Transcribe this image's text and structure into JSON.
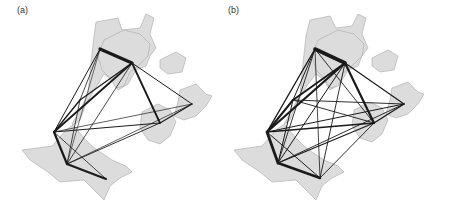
{
  "figure": {
    "colors": {
      "land": "#dcdcdc",
      "land_stroke": "#a8a8a8",
      "edge": "#1a1a1a",
      "background": "#ffffff"
    },
    "panels": [
      {
        "id": "a",
        "label": "(a)",
        "label_pos": [
          17,
          14
        ],
        "offset": [
          0,
          0
        ],
        "nodes": [
          {
            "id": "n1",
            "x": 100,
            "y": 49
          },
          {
            "id": "n2",
            "x": 132,
            "y": 63
          },
          {
            "id": "n3",
            "x": 192,
            "y": 104
          },
          {
            "id": "n4",
            "x": 160,
            "y": 123
          },
          {
            "id": "n5",
            "x": 54,
            "y": 132
          },
          {
            "id": "n6",
            "x": 67,
            "y": 164
          },
          {
            "id": "n7",
            "x": 106,
            "y": 179
          },
          {
            "id": "n8",
            "x": 80,
            "y": 100
          }
        ],
        "edges": [
          {
            "from": "n1",
            "to": "n2",
            "w": 3.2
          },
          {
            "from": "n2",
            "to": "n3",
            "w": 1.0
          },
          {
            "from": "n2",
            "to": "n4",
            "w": 1.8
          },
          {
            "from": "n3",
            "to": "n4",
            "w": 1.2
          },
          {
            "from": "n2",
            "to": "n5",
            "w": 1.8
          },
          {
            "from": "n2",
            "to": "n8",
            "w": 1.2
          },
          {
            "from": "n2",
            "to": "n6",
            "w": 0.8
          },
          {
            "from": "n1",
            "to": "n5",
            "w": 1.0
          },
          {
            "from": "n1",
            "to": "n8",
            "w": 0.8
          },
          {
            "from": "n1",
            "to": "n6",
            "w": 0.6
          },
          {
            "from": "n5",
            "to": "n4",
            "w": 1.0
          },
          {
            "from": "n5",
            "to": "n3",
            "w": 0.7
          },
          {
            "from": "n5",
            "to": "n6",
            "w": 2.2
          },
          {
            "from": "n5",
            "to": "n7",
            "w": 0.8
          },
          {
            "from": "n6",
            "to": "n7",
            "w": 2.0
          },
          {
            "from": "n6",
            "to": "n4",
            "w": 0.9
          },
          {
            "from": "n6",
            "to": "n3",
            "w": 0.7
          },
          {
            "from": "n8",
            "to": "n5",
            "w": 1.4
          },
          {
            "from": "n8",
            "to": "n6",
            "w": 0.8
          }
        ]
      },
      {
        "id": "b",
        "label": "(b)",
        "label_pos": [
          228,
          14
        ],
        "offset": [
          0,
          0
        ],
        "nodes": [
          {
            "id": "n1",
            "x": 315,
            "y": 49
          },
          {
            "id": "n2",
            "x": 345,
            "y": 63
          },
          {
            "id": "n3",
            "x": 404,
            "y": 104
          },
          {
            "id": "n4",
            "x": 374,
            "y": 123
          },
          {
            "id": "n5",
            "x": 267,
            "y": 132
          },
          {
            "id": "n6",
            "x": 278,
            "y": 163
          },
          {
            "id": "n7",
            "x": 320,
            "y": 178
          },
          {
            "id": "n8",
            "x": 293,
            "y": 100
          }
        ],
        "edges": [
          {
            "from": "n1",
            "to": "n2",
            "w": 3.6
          },
          {
            "from": "n2",
            "to": "n3",
            "w": 1.2
          },
          {
            "from": "n2",
            "to": "n4",
            "w": 2.2
          },
          {
            "from": "n3",
            "to": "n4",
            "w": 1.4
          },
          {
            "from": "n2",
            "to": "n5",
            "w": 2.2
          },
          {
            "from": "n2",
            "to": "n8",
            "w": 1.8
          },
          {
            "from": "n2",
            "to": "n6",
            "w": 1.0
          },
          {
            "from": "n2",
            "to": "n7",
            "w": 0.9
          },
          {
            "from": "n1",
            "to": "n5",
            "w": 1.4
          },
          {
            "from": "n1",
            "to": "n8",
            "w": 1.0
          },
          {
            "from": "n1",
            "to": "n6",
            "w": 0.9
          },
          {
            "from": "n1",
            "to": "n4",
            "w": 0.9
          },
          {
            "from": "n1",
            "to": "n7",
            "w": 0.8
          },
          {
            "from": "n5",
            "to": "n4",
            "w": 1.4
          },
          {
            "from": "n5",
            "to": "n3",
            "w": 1.0
          },
          {
            "from": "n5",
            "to": "n6",
            "w": 2.8
          },
          {
            "from": "n5",
            "to": "n7",
            "w": 1.0
          },
          {
            "from": "n6",
            "to": "n7",
            "w": 2.4
          },
          {
            "from": "n6",
            "to": "n4",
            "w": 1.2
          },
          {
            "from": "n6",
            "to": "n3",
            "w": 0.9
          },
          {
            "from": "n7",
            "to": "n4",
            "w": 0.9
          },
          {
            "from": "n8",
            "to": "n5",
            "w": 2.0
          },
          {
            "from": "n8",
            "to": "n6",
            "w": 1.0
          },
          {
            "from": "n8",
            "to": "n3",
            "w": 0.9
          },
          {
            "from": "n8",
            "to": "n4",
            "w": 0.9
          }
        ]
      }
    ]
  }
}
